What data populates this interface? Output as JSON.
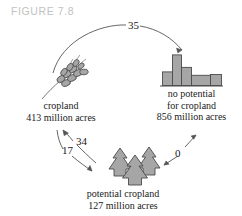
{
  "figure": {
    "title": "FIGURE 7.8",
    "title_color": "#c2c2c2"
  },
  "colors": {
    "fill": "#a6a6a6",
    "stroke": "#4a4a4a",
    "text": "#1a1a1a",
    "arrow": "#555555"
  },
  "nodes": [
    {
      "id": "cropland",
      "icon": "wheat-icon",
      "label_line1": "cropland",
      "label_line2": "413 million acres",
      "value": 413,
      "unit": "million acres"
    },
    {
      "id": "no-potential",
      "icon": "bar-chart-icon",
      "label_line1": "no potential",
      "label_line2": "for cropland",
      "label_line3": "856 million acres",
      "value": 856,
      "unit": "million acres"
    },
    {
      "id": "potential-cropland",
      "icon": "trees-icon",
      "label_line1": "potential cropland",
      "label_line2": "127 million acres",
      "value": 127,
      "unit": "million acres"
    }
  ],
  "flows": [
    {
      "id": "cropland-to-no-potential",
      "label": "35",
      "from": "cropland",
      "to": "no-potential"
    },
    {
      "id": "potential-to-cropland",
      "label": "34",
      "from": "potential-cropland",
      "to": "cropland"
    },
    {
      "id": "cropland-to-potential",
      "label": "17",
      "from": "cropland",
      "to": "potential-cropland"
    },
    {
      "id": "potential-no-potential",
      "label": "0",
      "from": "potential-cropland",
      "to": "no-potential"
    }
  ],
  "chart_data": {
    "type": "bar",
    "title": "",
    "xlabel": "",
    "ylabel": "",
    "categories": [
      "1",
      "2",
      "3",
      "4",
      "5"
    ],
    "values": [
      22,
      12,
      27,
      16,
      9
    ],
    "ylim": [
      0,
      30
    ],
    "grid": false,
    "legend": "none"
  }
}
